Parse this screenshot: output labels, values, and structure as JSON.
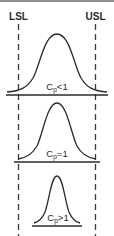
{
  "diagram": {
    "spec_limits": {
      "lower": {
        "label": "LSL",
        "x": 18.5
      },
      "upper": {
        "label": "USL",
        "x": 95.5
      }
    },
    "colors": {
      "line": "#2a2a2a",
      "dash": "#3a3a3a",
      "top_rule": "#6a6a6a",
      "background": "#ffffff"
    },
    "curves": [
      {
        "label_main": "C",
        "label_sub": "p",
        "label_rel": "<1",
        "description": "Distribution wider than spec limits",
        "peak_y": 34,
        "baseline_y": 95,
        "x_start": 7,
        "x_end": 107
      },
      {
        "label_main": "C",
        "label_sub": "p",
        "label_rel": "=1",
        "description": "Distribution equal to spec limits",
        "peak_y": 103,
        "baseline_y": 162,
        "x_start": 14,
        "x_end": 100
      },
      {
        "label_main": "C",
        "label_sub": "p",
        "label_rel": ">1",
        "description": "Distribution narrower than spec limits",
        "peak_y": 176,
        "baseline_y": 226,
        "x_start": 32,
        "x_end": 82
      }
    ]
  }
}
